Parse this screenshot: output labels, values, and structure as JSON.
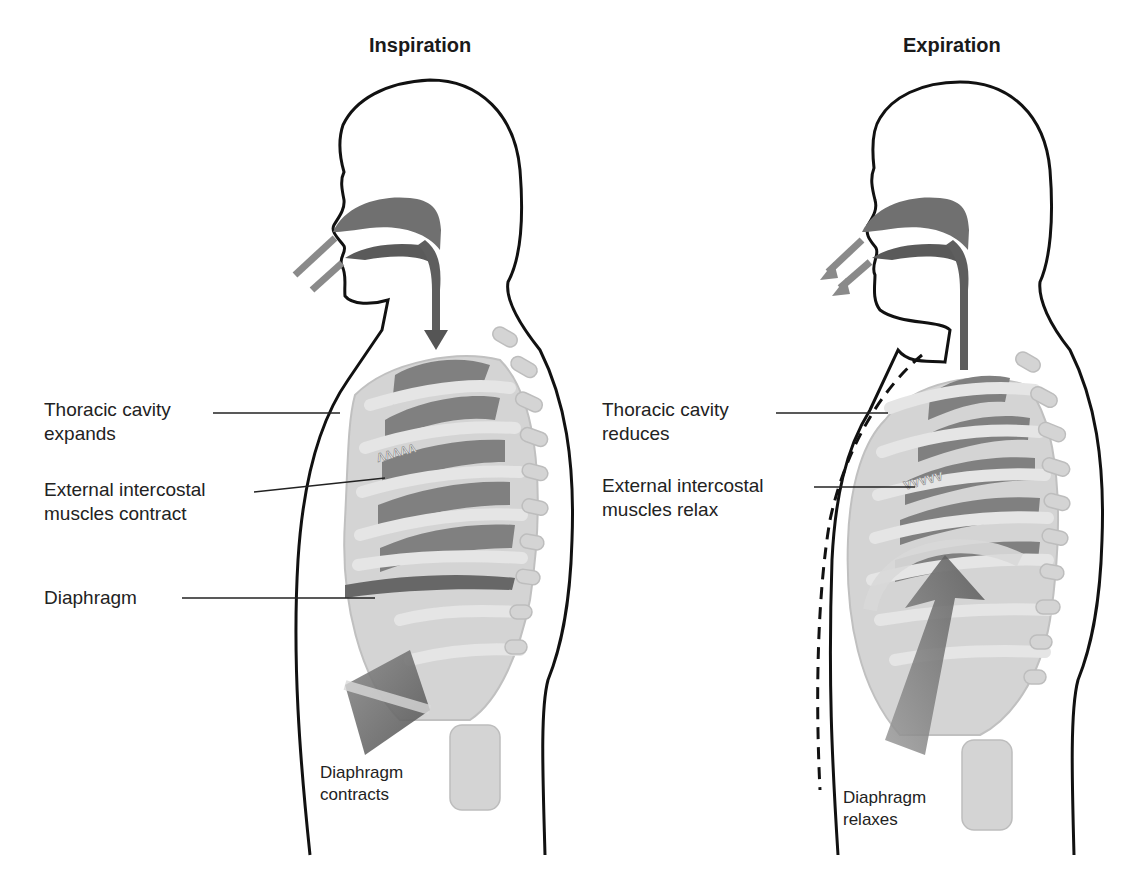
{
  "panels": [
    {
      "id": "inspiration",
      "title": "Inspiration",
      "labels": {
        "thoracic": {
          "line1": "Thoracic cavity",
          "line2": "expands"
        },
        "intercostal": {
          "line1": "External intercostal",
          "line2": "muscles  contract"
        },
        "diaphragm": {
          "line1": "Diaphragm"
        },
        "diaphragm_state": {
          "line1": "Diaphragm",
          "line2": "contracts"
        }
      },
      "airflow": "in"
    },
    {
      "id": "expiration",
      "title": "Expiration",
      "labels": {
        "thoracic": {
          "line1": "Thoracic cavity",
          "line2": "reduces"
        },
        "intercostal": {
          "line1": "External intercostal",
          "line2": "muscles  relax"
        },
        "diaphragm_state": {
          "line1": "Diaphragm",
          "line2": "relaxes"
        }
      },
      "airflow": "out"
    }
  ],
  "colors": {
    "outline": "#111111",
    "airway": "#6e6e6e",
    "airway_dark": "#555555",
    "bone": "#cfcfcf",
    "bone_edge": "#b5b5b5",
    "lung": "#7a7a7a",
    "diaphragm": "#5f5f5f",
    "air_arrow": "#8a8a8a"
  }
}
